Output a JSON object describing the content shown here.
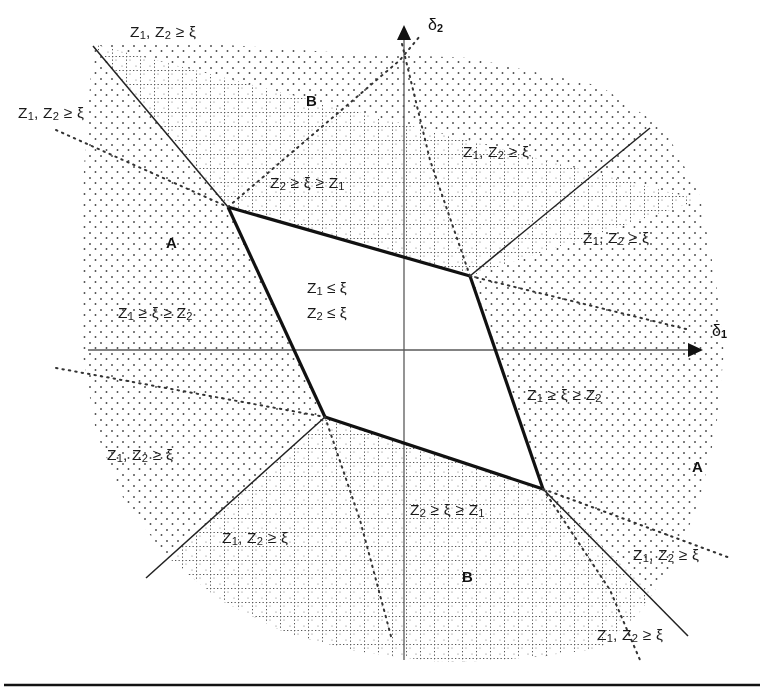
{
  "figure": {
    "title": "",
    "axes": {
      "x_label": "δ1",
      "x_label_main": "δ",
      "x_label_sub": "1",
      "y_label": "δ2",
      "y_label_main": "δ",
      "y_label_sub": "2",
      "origin_x": 404,
      "origin_y": 350
    },
    "colors": {
      "line": "#111111",
      "axis": "#444444",
      "stipple": "#555555",
      "grid": "#666666",
      "background": "#ffffff",
      "rule": "#111111"
    },
    "labels": [
      {
        "id": "top-outer",
        "text": "Z1, Z2 ≥ ξ",
        "parts": [
          "Z",
          "1",
          ", Z",
          "2",
          " ≥ ξ"
        ],
        "x": 130,
        "y": 22
      },
      {
        "id": "upper-left-outer",
        "text": "Z1, Z2 ≥ ξ",
        "parts": [
          "Z",
          "1",
          ", Z",
          "2",
          " ≥ ξ"
        ],
        "x": 18,
        "y": 103
      },
      {
        "id": "upper-right-in",
        "text": "Z1, Z2 ≥ ξ",
        "parts": [
          "Z",
          "1",
          ", Z",
          "2",
          " ≥ ξ"
        ],
        "x": 463,
        "y": 142
      },
      {
        "id": "upper-mid",
        "text": "Z2 ≥ ξ ≥ Z1",
        "parts": [
          "Z",
          "2",
          " ≥ ξ ≥ Z",
          "1",
          ""
        ],
        "x": 270,
        "y": 173
      },
      {
        "id": "right-outer",
        "text": "Z1, Z2 ≥ ξ",
        "parts": [
          "Z",
          "1",
          ", Z",
          "2",
          " ≥ ξ"
        ],
        "x": 583,
        "y": 228
      },
      {
        "id": "left-mid",
        "text": "Z1 ≥ ξ ≥ Z2",
        "parts": [
          "Z",
          "1",
          " ≥ ξ ≥ Z",
          "2",
          ""
        ],
        "x": 118,
        "y": 303
      },
      {
        "id": "right-mid",
        "text": "Z1 ≥ ξ ≥ Z2",
        "parts": [
          "Z",
          "1",
          " ≥ ξ ≥ Z",
          "2",
          ""
        ],
        "x": 527,
        "y": 385
      },
      {
        "id": "lower-left-outer",
        "text": "Z1, Z2 ≥ ξ",
        "parts": [
          "Z",
          "1",
          ", Z",
          "2",
          " ≥ ξ"
        ],
        "x": 107,
        "y": 445
      },
      {
        "id": "lower-left-in",
        "text": "Z1, Z2 ≥ ξ",
        "parts": [
          "Z",
          "1",
          ", Z",
          "2",
          " ≥ ξ"
        ],
        "x": 222,
        "y": 528
      },
      {
        "id": "lower-mid",
        "text": "Z2 ≥ ξ ≥ Z1",
        "parts": [
          "Z",
          "2",
          " ≥ ξ ≥ Z",
          "1",
          ""
        ],
        "x": 410,
        "y": 500
      },
      {
        "id": "lower-right-in",
        "text": "Z1, Z2 ≥ ξ",
        "parts": [
          "Z",
          "1",
          ", Z",
          "2",
          " ≥ ξ"
        ],
        "x": 633,
        "y": 545
      },
      {
        "id": "lower-right-out",
        "text": "Z1, Z2 ≥ ξ",
        "parts": [
          "Z",
          "1",
          ", Z",
          "2",
          " ≥ ξ"
        ],
        "x": 597,
        "y": 625
      }
    ],
    "center_label": {
      "line1_parts": [
        "Z",
        "1",
        " ≤ ξ"
      ],
      "line2_parts": [
        "Z",
        "2",
        " ≤ ξ"
      ],
      "line1": "Z1 ≤ ξ",
      "line2": "Z2 ≤ ξ",
      "x": 307,
      "y": 276
    },
    "region_letters": [
      {
        "id": "A-upper-left",
        "text": "A",
        "x": 166,
        "y": 234
      },
      {
        "id": "B-upper",
        "text": "B",
        "x": 306,
        "y": 92
      },
      {
        "id": "A-lower-right",
        "text": "A",
        "x": 692,
        "y": 458
      },
      {
        "id": "B-lower",
        "text": "B",
        "x": 462,
        "y": 568
      }
    ],
    "polygon": {
      "name": "central-white-region",
      "vertices": [
        [
          228,
          207
        ],
        [
          470,
          276
        ],
        [
          543,
          489
        ],
        [
          325,
          417
        ]
      ]
    },
    "bottom_rule": {
      "y": 685
    }
  }
}
